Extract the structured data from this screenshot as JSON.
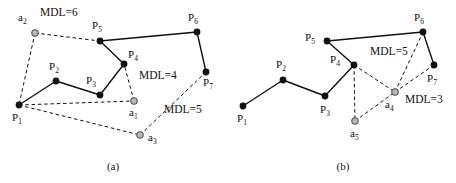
{
  "figure": {
    "background": "#ffffff",
    "stroke_color": "#111111",
    "point_fill": "#111111",
    "anchor_fill": "#b8b8b8",
    "anchor_stroke": "#555555"
  },
  "panels": [
    {
      "id": "panel-a",
      "caption": "(a)",
      "caption_pos": {
        "x": 113,
        "y": 170
      },
      "trajectory_points": [
        {
          "id": "P1",
          "label": "P",
          "sub": "1",
          "x": 19,
          "y": 105,
          "label_x": 12,
          "label_y": 121
        },
        {
          "id": "P2",
          "label": "P",
          "sub": "2",
          "x": 56,
          "y": 81,
          "label_x": 49,
          "label_y": 70
        },
        {
          "id": "P3",
          "label": "P",
          "sub": "3",
          "x": 100,
          "y": 95,
          "label_x": 86,
          "label_y": 84
        },
        {
          "id": "P4",
          "label": "P",
          "sub": "4",
          "x": 124,
          "y": 64,
          "label_x": 128,
          "label_y": 58
        },
        {
          "id": "P5",
          "label": "P",
          "sub": "5",
          "x": 100,
          "y": 41,
          "label_x": 92,
          "label_y": 29
        },
        {
          "id": "P6",
          "label": "P",
          "sub": "6",
          "x": 197,
          "y": 32,
          "label_x": 188,
          "label_y": 21
        },
        {
          "id": "P7",
          "label": "P",
          "sub": "7",
          "x": 206,
          "y": 72,
          "label_x": 203,
          "label_y": 86
        }
      ],
      "anchor_points": [
        {
          "id": "a1",
          "label": "a",
          "sub": "1",
          "x": 134,
          "y": 101,
          "label_x": 129,
          "label_y": 116
        },
        {
          "id": "a2",
          "label": "a",
          "sub": "2",
          "x": 35,
          "y": 33,
          "label_x": 18,
          "label_y": 21
        },
        {
          "id": "a3",
          "label": "a",
          "sub": "3",
          "x": 140,
          "y": 135,
          "label_x": 148,
          "label_y": 141
        }
      ],
      "solid_edges": [
        [
          "P1",
          "P2"
        ],
        [
          "P2",
          "P3"
        ],
        [
          "P3",
          "P4"
        ],
        [
          "P4",
          "P5"
        ],
        [
          "P5",
          "P6"
        ],
        [
          "P6",
          "P7"
        ]
      ],
      "dashed_edges": [
        [
          "a2",
          "P5"
        ],
        [
          "a2",
          "P1"
        ],
        [
          "P1",
          "a1"
        ],
        [
          "a1",
          "P4"
        ],
        [
          "P1",
          "a3"
        ],
        [
          "a3",
          "P7"
        ]
      ],
      "mdl_labels": [
        {
          "text": "MDL=6",
          "x": 40,
          "y": 16
        },
        {
          "text": "MDL=4",
          "x": 139,
          "y": 79
        },
        {
          "text": "MDL=5",
          "x": 164,
          "y": 113
        }
      ]
    },
    {
      "id": "panel-b",
      "caption": "(b)",
      "caption_pos": {
        "x": 343,
        "y": 170
      },
      "trajectory_points": [
        {
          "id": "P1",
          "label": "P",
          "sub": "1",
          "x": 243,
          "y": 106,
          "label_x": 237,
          "label_y": 122
        },
        {
          "id": "P2",
          "label": "P",
          "sub": "2",
          "x": 283,
          "y": 80,
          "label_x": 276,
          "label_y": 68
        },
        {
          "id": "P3",
          "label": "P",
          "sub": "3",
          "x": 325,
          "y": 96,
          "label_x": 320,
          "label_y": 113
        },
        {
          "id": "P4",
          "label": "P",
          "sub": "4",
          "x": 354,
          "y": 65,
          "label_x": 330,
          "label_y": 63
        },
        {
          "id": "P5",
          "label": "P",
          "sub": "5",
          "x": 327,
          "y": 41,
          "label_x": 305,
          "label_y": 41
        },
        {
          "id": "P6",
          "label": "P",
          "sub": "6",
          "x": 423,
          "y": 32,
          "label_x": 414,
          "label_y": 21
        },
        {
          "id": "P7",
          "label": "P",
          "sub": "7",
          "x": 434,
          "y": 65,
          "label_x": 427,
          "label_y": 82
        }
      ],
      "anchor_points": [
        {
          "id": "a4",
          "label": "a",
          "sub": "4",
          "x": 395,
          "y": 92,
          "label_x": 385,
          "label_y": 108
        },
        {
          "id": "a5",
          "label": "a",
          "sub": "5",
          "x": 355,
          "y": 121,
          "label_x": 350,
          "label_y": 137
        }
      ],
      "solid_edges": [
        [
          "P1",
          "P2"
        ],
        [
          "P2",
          "P3"
        ],
        [
          "P3",
          "P4"
        ],
        [
          "P4",
          "P5"
        ],
        [
          "P5",
          "P6"
        ],
        [
          "P6",
          "P7"
        ]
      ],
      "dashed_edges": [
        [
          "P4",
          "a4"
        ],
        [
          "P4",
          "a5"
        ],
        [
          "a5",
          "a4"
        ],
        [
          "a4",
          "P6"
        ],
        [
          "a4",
          "P7"
        ]
      ],
      "mdl_labels": [
        {
          "text": "MDL=5",
          "x": 370,
          "y": 55
        },
        {
          "text": "MDL=3",
          "x": 405,
          "y": 103
        }
      ]
    }
  ]
}
